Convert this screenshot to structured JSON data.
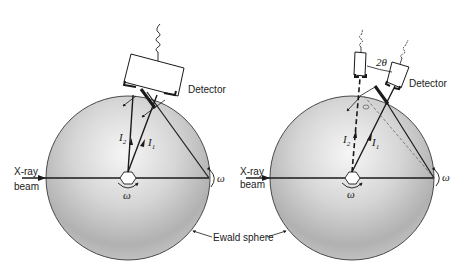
{
  "figure": {
    "panels": [
      {
        "id": "left",
        "labels": {
          "detector": "Detector",
          "beam_line1": "X-ray",
          "beam_line2": "beam",
          "i2": "I",
          "i2_sub": "2",
          "i1": "I",
          "i1_sub": "1",
          "omega_center": "ω",
          "omega_edge": "ω"
        }
      },
      {
        "id": "right",
        "labels": {
          "detector": "Detector",
          "angle": "2θ",
          "beam_line1": "X-ray",
          "beam_line2": "beam",
          "i2": "I",
          "i2_sub": "2",
          "i1": "I",
          "i1_sub": "1",
          "omega_center": "ω",
          "omega_edge": "ω"
        }
      }
    ],
    "shared_label": "Ewald sphere",
    "colors": {
      "ink": "#1a1a1a",
      "sphere_light": "#f4f4f4",
      "sphere_dark": "#a9a9a9"
    }
  }
}
